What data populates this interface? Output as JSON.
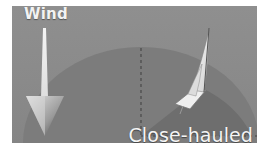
{
  "diagram": {
    "wind_label": "Wind",
    "point_of_sail_label": "Close-hauled",
    "icons": {
      "wind_arrow": "down-arrow-icon",
      "boat": "sailboat-icon"
    },
    "colors": {
      "background": "#8a8a8a",
      "disc": "#7a7a7a",
      "sector": "#6c6c6c",
      "dashed_lines": "#5a5a5a",
      "text": "#f4f4f4"
    }
  }
}
